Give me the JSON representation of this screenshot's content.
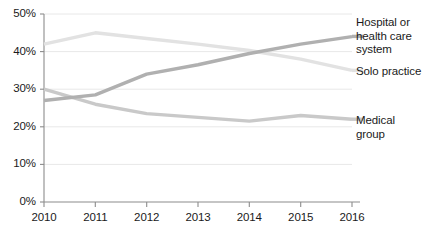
{
  "chart_data": {
    "type": "line",
    "title": "",
    "subtitle": "",
    "xlabel": "",
    "ylabel": "",
    "x": [
      2010,
      2011,
      2012,
      2013,
      2014,
      2015,
      2016
    ],
    "xtick_labels": [
      "2010",
      "2011",
      "2012",
      "2013",
      "2014",
      "2015",
      "2016"
    ],
    "ytick_labels": [
      "0%",
      "10%",
      "20%",
      "30%",
      "40%",
      "50%"
    ],
    "ytick_values": [
      0,
      10,
      20,
      30,
      40,
      50
    ],
    "ylim": [
      0,
      50
    ],
    "xlim": [
      2010,
      2016
    ],
    "grid": "horizontal",
    "legend_position": "right-inline-labels",
    "series": [
      {
        "name": "Solo practice",
        "color": "#e2e2e2",
        "label": "Solo practice",
        "values": [
          42.0,
          45.0,
          43.5,
          42.0,
          40.3,
          38.0,
          35.0
        ]
      },
      {
        "name": "Hospital or health care system",
        "color": "#b0b0b0",
        "label": "Hospital or health care system",
        "values": [
          27.0,
          28.5,
          34.0,
          36.5,
          39.5,
          42.0,
          44.0
        ]
      },
      {
        "name": "Medical group",
        "color": "#c9c9c9",
        "label": "Medical group",
        "values": [
          30.0,
          26.0,
          23.5,
          22.5,
          21.5,
          23.0,
          22.0
        ]
      }
    ]
  },
  "axis": {
    "ytick_0": "0%",
    "ytick_1": "10%",
    "ytick_2": "20%",
    "ytick_3": "30%",
    "ytick_4": "40%",
    "ytick_5": "50%",
    "xtick_0": "2010",
    "xtick_1": "2011",
    "xtick_2": "2012",
    "xtick_3": "2013",
    "xtick_4": "2014",
    "xtick_5": "2015",
    "xtick_6": "2016"
  },
  "labels": {
    "hospital_line1": "Hospital or",
    "hospital_line2": "health care",
    "hospital_line3": "system",
    "solo": "Solo practice",
    "medical_group": "Medical group"
  },
  "colors": {
    "solo_practice": "#e2e2e2",
    "hospital": "#b0b0b0",
    "medical_group": "#c9c9c9",
    "axis": "#8c8c8c",
    "grid": "#e8e8e8",
    "text": "#1a1a1a"
  }
}
